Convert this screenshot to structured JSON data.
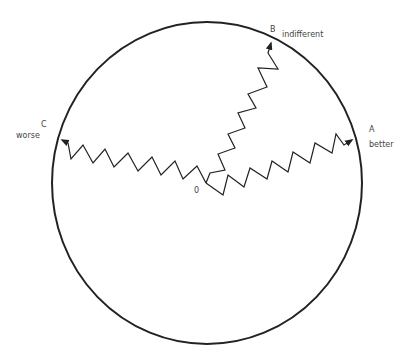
{
  "diagram": {
    "type": "circle-with-random-walk-paths",
    "colors": {
      "stroke": "#222222",
      "text": "#444444",
      "background": "#ffffff"
    },
    "circle": {
      "cx": 207,
      "cy": 183,
      "rx": 155,
      "ry": 161
    },
    "origin": {
      "label": "0",
      "x": 206,
      "y": 183
    },
    "endpoints": [
      {
        "id": "A",
        "letter": "A",
        "caption": "better",
        "x": 355,
        "y": 139
      },
      {
        "id": "B",
        "letter": "B",
        "caption": "indifferent",
        "x": 272,
        "y": 39
      },
      {
        "id": "C",
        "letter": "C",
        "caption": "worse",
        "x": 58,
        "y": 139
      }
    ],
    "paths": {
      "to_A": "206,183 223,195 228,175 244,187 250,168 267,179 272,161 288,172 293,152 310,163 315,143 332,153 336,134 344,145 352,140",
      "to_B": "206,183 210,173 225,170 218,154 235,148 228,134 245,128 238,113 256,108 248,94 267,87 258,68 278,69 268,53 271,43",
      "to_C": "206,183 197,166 183,179 175,161 161,175 152,157 138,171 128,153 114,167 105,149 93,163 83,145 71,159 68,143 62,140"
    }
  }
}
